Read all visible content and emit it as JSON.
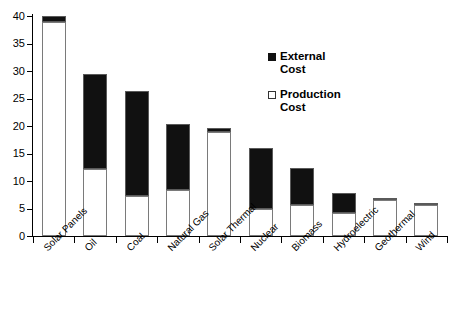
{
  "chart_data": {
    "type": "bar",
    "stacked": true,
    "title": "",
    "xlabel": "",
    "ylabel": "",
    "ylim": [
      0,
      40
    ],
    "ytick_interval": 5,
    "ytick_labels": [
      "0",
      "5",
      "10",
      "15",
      "20",
      "25",
      "30",
      "35",
      "40"
    ],
    "grid": false,
    "legend_position": "upper-right-inside",
    "categories": [
      "Solar Panels",
      "Oil",
      "Coal",
      "Natural Gas",
      "Solar Thermal",
      "Nuclear",
      "Biomass",
      "Hydroelectric",
      "Geothermal",
      "Wind"
    ],
    "series": [
      {
        "name": "Production Cost",
        "color": "#ffffff",
        "values": [
          39.0,
          12.1,
          7.2,
          8.3,
          19.0,
          5.0,
          5.7,
          4.2,
          6.6,
          5.6
        ]
      },
      {
        "name": "External Cost",
        "color": "#111111",
        "values": [
          1.0,
          17.4,
          19.1,
          12.0,
          0.7,
          11.0,
          6.7,
          3.7,
          0.4,
          0.4
        ]
      }
    ],
    "totals": [
      40.0,
      29.5,
      26.3,
      20.3,
      19.7,
      16.0,
      12.4,
      7.9,
      7.0,
      6.0
    ]
  },
  "legend": {
    "items": [
      {
        "label": "External\nCost",
        "label_line1": "External",
        "label_line2": "Cost",
        "marker": "filled-square"
      },
      {
        "label": "Production\nCost",
        "label_line1": "Production",
        "label_line2": "Cost",
        "marker": "open-square"
      }
    ]
  }
}
